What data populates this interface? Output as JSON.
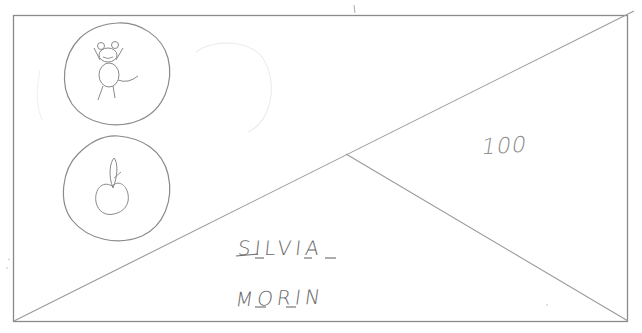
{
  "wireframe": {
    "description": "Hand-drawn wireframe sketch of a card",
    "stroke_color": "#8a8a8a",
    "text_color": "#6a6a6a",
    "icons": [
      {
        "name": "mouse-character-icon",
        "depicts": "cartoon mouse with round ears, raised arms, and tail"
      },
      {
        "name": "apple-icon",
        "depicts": "apple with stem"
      }
    ],
    "score": "100",
    "player": {
      "first_name": "SILVIA",
      "last_name": "MORIN"
    }
  }
}
